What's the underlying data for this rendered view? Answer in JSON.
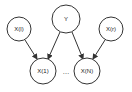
{
  "diagram": {
    "type": "directed-graph",
    "stroke_color": "#333333",
    "fill_color": "#ffffff",
    "nodes": [
      {
        "id": "xl",
        "label": "X(l)",
        "cx": 19,
        "cy": 29,
        "r": 12
      },
      {
        "id": "y",
        "label": "Y",
        "cx": 66,
        "cy": 19,
        "r": 14
      },
      {
        "id": "xr",
        "label": "X(r)",
        "cx": 111,
        "cy": 29,
        "r": 12
      },
      {
        "id": "x1",
        "label": "X(1)",
        "cx": 43,
        "cy": 71,
        "r": 13
      },
      {
        "id": "xn",
        "label": "X(N)",
        "cx": 87,
        "cy": 71,
        "r": 13
      }
    ],
    "ellipsis": {
      "label": "…",
      "x": 66,
      "y": 74
    },
    "edges": [
      {
        "from": "xl",
        "to": "x1"
      },
      {
        "from": "y",
        "to": "x1"
      },
      {
        "from": "y",
        "to": "xn"
      },
      {
        "from": "xr",
        "to": "xn"
      }
    ]
  }
}
